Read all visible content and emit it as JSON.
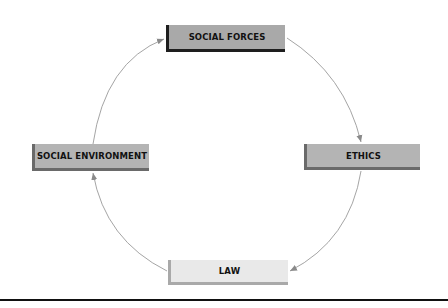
{
  "diagram": {
    "type": "cycle",
    "nodes": [
      {
        "id": "social-forces",
        "label": "SOCIAL FORCES"
      },
      {
        "id": "ethics",
        "label": "ETHICS"
      },
      {
        "id": "law",
        "label": "LAW"
      },
      {
        "id": "social-environment",
        "label": "SOCIAL ENVIRONMENT"
      }
    ],
    "edges": [
      {
        "from": "social-forces",
        "to": "ethics"
      },
      {
        "from": "ethics",
        "to": "law"
      },
      {
        "from": "law",
        "to": "social-environment"
      },
      {
        "from": "social-environment",
        "to": "social-forces"
      }
    ],
    "colors": {
      "arc": "#9a9a9a",
      "box_dark": "#a9a9a9",
      "box_light": "#e9e9e9",
      "rule": "#111111"
    }
  }
}
